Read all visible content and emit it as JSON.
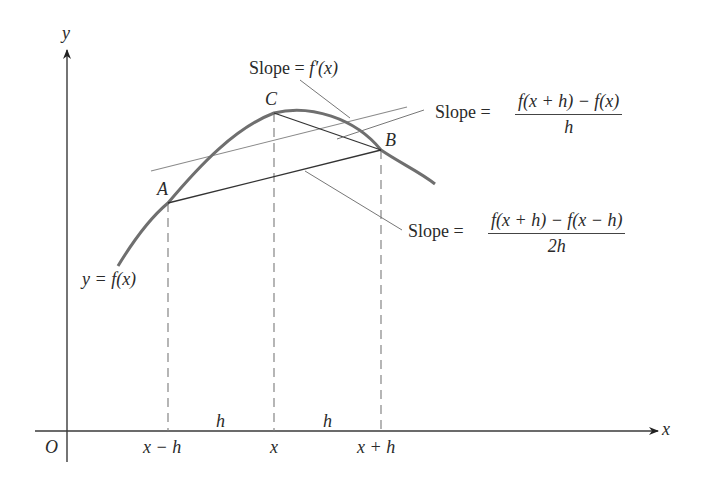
{
  "diagram": {
    "colors": {
      "curve": "#6f6f6f",
      "axis": "#3a3a3a",
      "secant": "#333333",
      "tangent": "#8a8a8a",
      "dashed": "#7a7a7a",
      "pointer": "#777777"
    },
    "axes": {
      "x_label": "x",
      "y_label": "y",
      "origin_label": "O"
    },
    "curve_label": "y = f(x)",
    "points": [
      {
        "name": "A",
        "label": "A"
      },
      {
        "name": "C",
        "label": "C"
      },
      {
        "name": "B",
        "label": "B"
      }
    ],
    "x_ticks": [
      "x − h",
      "x",
      "x + h"
    ],
    "interval_labels": [
      "h",
      "h"
    ],
    "annotations": {
      "tangent": {
        "prefix": "Slope = ",
        "expr": "f′(x)"
      },
      "forward": {
        "prefix": "Slope = ",
        "numerator": "f(x + h) − f(x)",
        "denominator": "h"
      },
      "central": {
        "prefix": "Slope = ",
        "numerator": "f(x + h) − f(x − h)",
        "denominator": "2h"
      }
    }
  }
}
